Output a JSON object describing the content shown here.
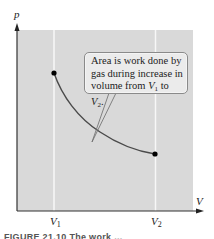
{
  "diagram": {
    "type": "pV-diagram",
    "axes": {
      "y_label": "p",
      "x_label": "V",
      "x_ticks": [
        {
          "label": "V",
          "subscript": "1"
        },
        {
          "label": "V",
          "subscript": "2"
        }
      ]
    },
    "curve": {
      "description": "decreasing pressure curve from V1 to V2",
      "start_point": "V1",
      "end_point": "V2"
    },
    "callout": {
      "line1": "Area is work done by",
      "line2": "gas during increase in",
      "line3_prefix": "volume from ",
      "line3_v1": "V",
      "line3_v1_sub": "1",
      "line3_mid": " to ",
      "line3_v2": "V",
      "line3_v2_sub": "2",
      "line3_suffix": "."
    },
    "caption_fragment": "FIGURE 21.10  The work ... ",
    "colors": {
      "plot_background": "#d9d9d9",
      "gridline": "#f7f7f7",
      "curve": "#4a4a4a",
      "axis": "#333333",
      "point": "#000000"
    }
  }
}
